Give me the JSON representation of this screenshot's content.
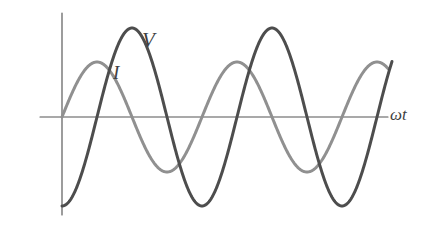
{
  "figure": {
    "background_color": "#ffffff"
  },
  "axes": {
    "x_axis_label": "ωt",
    "x_axis_name": "omega-t",
    "y_axis_label": "",
    "axis_color": "#545454",
    "origin_px": {
      "x": 62,
      "y": 117
    },
    "x_axis_start_px": 40,
    "x_axis_end_px": 388,
    "y_axis_top_px": 13,
    "y_axis_bottom_px": 215
  },
  "labels": {
    "voltage": "V",
    "current": "I",
    "omega_t": "ωt"
  },
  "chart_data": {
    "type": "line",
    "xlabel": "ωt",
    "ylabel": "",
    "grid": false,
    "legend_position": "inline-annotation",
    "x_range_rad": [
      0,
      9.7
    ],
    "series": [
      {
        "name": "V",
        "label": "V",
        "color": "#4d4d4d",
        "stroke_width": 3.0,
        "amplitude_px": 89,
        "period_px": 140,
        "phase_deg": -90,
        "description": "Voltage waveform, larger amplitude, starts at minimum at the vertical axis and rises",
        "peaks_px": [
          {
            "x": 125,
            "y": 28
          },
          {
            "x": 265,
            "y": 29
          }
        ],
        "troughs_px": [
          {
            "x": 195,
            "y": 205
          },
          {
            "x": 335,
            "y": 206
          }
        ],
        "start_px": {
          "x": 62,
          "y": 212
        },
        "end_px": {
          "x": 390,
          "y": 44
        }
      },
      {
        "name": "I",
        "label": "I",
        "color": "#909090",
        "stroke_width": 3.0,
        "amplitude_px": 55,
        "period_px": 140,
        "phase_deg": 0,
        "description": "Current waveform, smaller amplitude, leads the voltage by 90 degrees, starts at zero rising",
        "peaks_px": [
          {
            "x": 90,
            "y": 62
          },
          {
            "x": 230,
            "y": 62
          },
          {
            "x": 372,
            "y": 62
          }
        ],
        "troughs_px": [
          {
            "x": 160,
            "y": 172
          },
          {
            "x": 300,
            "y": 172
          }
        ],
        "start_px": {
          "x": 62,
          "y": 117
        },
        "end_px": {
          "x": 388,
          "y": 73
        }
      }
    ]
  },
  "colors": {
    "voltage_curve": "#4d4d4d",
    "current_curve": "#909090",
    "axis": "#545454",
    "text": "#3f3f3f",
    "background": "#ffffff"
  }
}
